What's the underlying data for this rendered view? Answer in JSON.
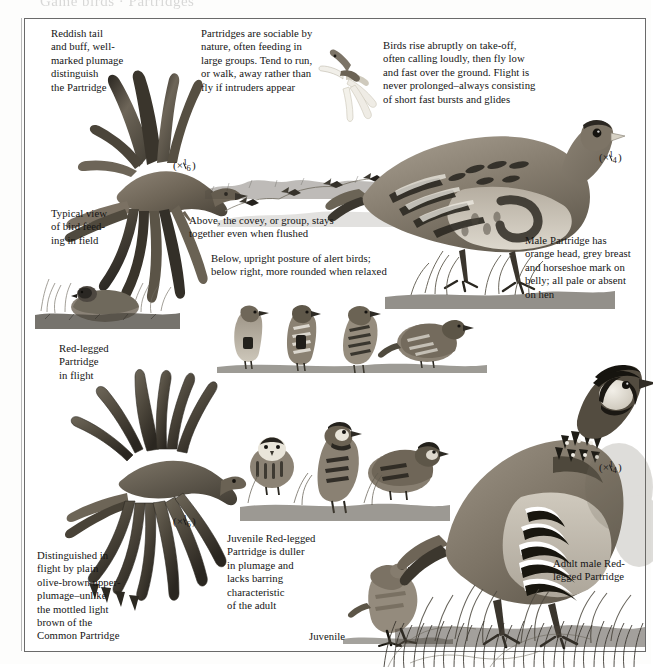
{
  "page": {
    "top_cut_text": "Game birds · Partridges",
    "background_color": "#fdfdfc",
    "border_color": "#6a6a6a"
  },
  "captions": [
    {
      "id": "reddish-tail",
      "text": "Reddish tail\nand buff, well-\nmarked plumage\ndistinguish\nthe Partridge"
    },
    {
      "id": "sociable",
      "text": "Partridges are sociable by\nnature, often feeding in\nlarge groups. Tend to run,\nor walk, away rather than\nfly if intruders appear"
    },
    {
      "id": "take-off",
      "text": "Birds rise abruptly on take-off,\noften calling loudly, then fly low\nand fast over the ground. Flight is\nnever prolonged–always consisting\nof short fast bursts and glides"
    },
    {
      "id": "typical-view",
      "text": "Typical view\nof bird feed-\ning in field"
    },
    {
      "id": "covey",
      "text": "Above, the covey, or group, stays\ntogether even when flushed"
    },
    {
      "id": "posture",
      "text": "Below, upright posture of alert birds;\nbelow right, more rounded when relaxed"
    },
    {
      "id": "male-partridge",
      "text": "Male Partridge has\norange head, grey breast\nand horseshoe mark on\nbelly; all pale or absent\non hen"
    },
    {
      "id": "red-legged-flight",
      "text": "Red-legged\nPartridge\nin flight"
    },
    {
      "id": "distinguished",
      "text": "Distinguished in\nflight by plain\nolive-brown upper-\nplumage–unlike\nthe mottled light\nbrown of the\nCommon Partridge"
    },
    {
      "id": "juvenile-desc",
      "text": "Juvenile Red-legged\nPartridge is duller\nin plumage and\nlacks barring\ncharacteristic\nof the adult"
    },
    {
      "id": "juvenile-label",
      "text": "Juvenile"
    },
    {
      "id": "adult-male",
      "text": "Adult male Red-\nlegged Partridge"
    }
  ],
  "scales": [
    {
      "id": "scale-partridge-flight",
      "multiplier": "×",
      "numerator": "1",
      "denominator": "6"
    },
    {
      "id": "scale-partridge-standing",
      "multiplier": "×",
      "numerator": "1",
      "denominator": "4"
    },
    {
      "id": "scale-redlegged-flight",
      "multiplier": "×",
      "numerator": "1",
      "denominator": "6"
    },
    {
      "id": "scale-redlegged-adult",
      "multiplier": "×",
      "numerator": "1",
      "denominator": "4"
    }
  ],
  "illustrations": [
    {
      "id": "partridge-in-flight",
      "label": "Common Partridge in flight, upper left"
    },
    {
      "id": "partridge-flying-small",
      "label": "Partridge flying, small, upper centre"
    },
    {
      "id": "covey-flying",
      "label": "Covey of partridges flying in line"
    },
    {
      "id": "partridge-feeding",
      "label": "Partridge feeding in field, low in grass"
    },
    {
      "id": "partridge-standing-large",
      "label": "Male Common Partridge standing, large"
    },
    {
      "id": "alert-birds-row",
      "label": "Row of four alert and relaxed partridges"
    },
    {
      "id": "redlegged-in-flight",
      "label": "Red-legged Partridge in flight, lower left"
    },
    {
      "id": "redlegged-group",
      "label": "Group of red-legged partridges, centre"
    },
    {
      "id": "redlegged-juvenile",
      "label": "Juvenile Red-legged Partridge"
    },
    {
      "id": "redlegged-adult-large",
      "label": "Adult male Red-legged Partridge, large"
    }
  ]
}
